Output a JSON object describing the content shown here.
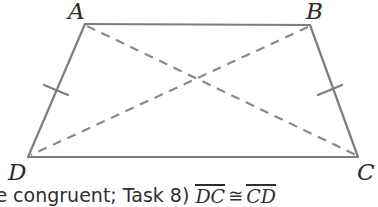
{
  "figure": {
    "kind": "geometry-diagram",
    "shape_name": "trapezoid-ABCD",
    "stroke_color": "#7d7d7d",
    "dash_color": "#8a8a8a",
    "label_color": "#2b2b2b",
    "background": "#ffffff",
    "vertices": {
      "A": {
        "label": "A",
        "x": 85,
        "y": 24
      },
      "B": {
        "label": "B",
        "x": 310,
        "y": 25
      },
      "C": {
        "label": "C",
        "x": 358,
        "y": 157
      },
      "D": {
        "label": "D",
        "x": 28,
        "y": 157
      }
    },
    "sides": [
      {
        "name": "AB",
        "from": "A",
        "to": "B",
        "style": "solid",
        "ticks": 0
      },
      {
        "name": "BC",
        "from": "B",
        "to": "C",
        "style": "solid",
        "ticks": 1
      },
      {
        "name": "DC",
        "from": "D",
        "to": "C",
        "style": "solid",
        "ticks": 0
      },
      {
        "name": "AD",
        "from": "A",
        "to": "D",
        "style": "solid",
        "ticks": 1
      }
    ],
    "diagonals": [
      {
        "name": "AC",
        "from": "A",
        "to": "C",
        "style": "dashed"
      },
      {
        "name": "BD",
        "from": "B",
        "to": "D",
        "style": "dashed"
      }
    ],
    "tick_marks": [
      {
        "on": "AD",
        "count": 1
      },
      {
        "on": "BC",
        "count": 1
      }
    ]
  },
  "caption": {
    "clipped_left": true,
    "clipped_right": false,
    "full_text": "re congruent; Task 8) DC ≅ CD",
    "prefix": "re congruent; Task 8)",
    "segment_left": "DC",
    "congruent_symbol": "≅",
    "segment_right": "CD"
  }
}
